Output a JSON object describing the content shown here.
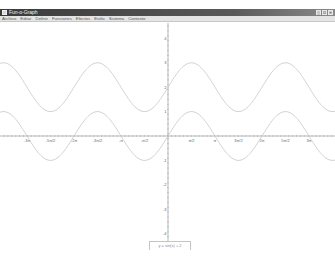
{
  "window": {
    "title": "Fun-o-Graph",
    "buttons": [
      "_",
      "□",
      "×"
    ]
  },
  "menubar": {
    "items": [
      "Archivo",
      "Editar",
      "Definir",
      "Funciones",
      "Efectos",
      "Estilo",
      "Sistema",
      "Contexto"
    ]
  },
  "input": {
    "value": "y = sin(x) + 2"
  },
  "colors": {
    "titlebar": "#3a3a3a",
    "menubar": "#e4e4e4",
    "axis": "#9a9a9a",
    "curve": "#c8c8c8"
  },
  "chart_data": {
    "type": "line",
    "title": "",
    "xlabel": "",
    "ylabel": "",
    "x_ticks": [
      "-3π",
      "-5π/2",
      "-2π",
      "-3π/2",
      "-π",
      "-π/2",
      "π/2",
      "π",
      "3π/2",
      "2π",
      "5π/2",
      "3π"
    ],
    "x_tick_values": [
      -9.4248,
      -7.854,
      -6.2832,
      -4.7124,
      -3.1416,
      -1.5708,
      1.5708,
      3.1416,
      4.7124,
      6.2832,
      7.854,
      9.4248
    ],
    "y_ticks": [
      "4",
      "3",
      "2",
      "1",
      "-1",
      "-2",
      "-3",
      "-4"
    ],
    "y_tick_values": [
      4,
      3,
      2,
      1,
      -1,
      -2,
      -3,
      -4
    ],
    "xlim": [
      -11.2,
      10.4
    ],
    "ylim": [
      -4.5,
      4.7
    ],
    "grid": false,
    "series": [
      {
        "name": "sin(x)",
        "expression": "sin(x)",
        "amplitude": 1,
        "offset": 0
      },
      {
        "name": "sin(x) + 2",
        "expression": "sin(x) + 2",
        "amplitude": 1,
        "offset": 2
      }
    ]
  }
}
